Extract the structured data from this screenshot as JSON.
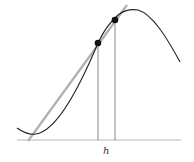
{
  "diagram": {
    "type": "secant-line-illustration",
    "label_h": "h",
    "colors": {
      "curve": "#222222",
      "secant": "#b0b0b0",
      "axis": "#b8b8b8",
      "verticals": "#888888",
      "points": "#111111"
    },
    "points": [
      {
        "name": "point-a",
        "x": 98,
        "y": 43
      },
      {
        "name": "point-b",
        "x": 115,
        "y": 20
      }
    ]
  }
}
